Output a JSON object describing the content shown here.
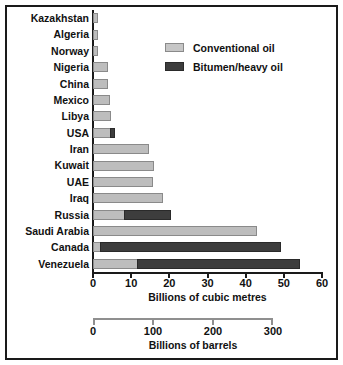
{
  "chart_data": {
    "type": "bar",
    "orientation": "horizontal",
    "stacked": true,
    "title": "",
    "xlabel": "Billions of cubic metres",
    "ylabel": "",
    "xlim": [
      0,
      60
    ],
    "xticks": [
      0,
      10,
      20,
      30,
      40,
      50,
      60
    ],
    "grid": false,
    "legend_position": "upper-right-inside",
    "categories": [
      "Kazakhstan",
      "Algeria",
      "Norway",
      "Nigeria",
      "China",
      "Mexico",
      "Libya",
      "USA",
      "Iran",
      "Kuwait",
      "UAE",
      "Iraq",
      "Russia",
      "Saudi Arabia",
      "Canada",
      "Venezuela"
    ],
    "series": [
      {
        "name": "Conventional oil",
        "color": "#bdbdbd",
        "values": [
          1.2,
          1.2,
          1.2,
          4.0,
          3.8,
          4.4,
          4.8,
          4.6,
          14.6,
          16.0,
          15.6,
          18.4,
          8.4,
          43.0,
          2.2,
          11.8
        ]
      },
      {
        "name": "Bitumen/heavy oil",
        "color": "#3d3d3d",
        "values": [
          0,
          0,
          0,
          0,
          0,
          0,
          0,
          1.4,
          0,
          0,
          0,
          0,
          12.4,
          0,
          47.2,
          42.8
        ]
      }
    ],
    "secondary_axis": {
      "xlabel": "Billions of barrels",
      "xticks": [
        0,
        100,
        200,
        300
      ],
      "xlim": [
        0,
        300
      ],
      "unit_ratio_barrels_per_cubic_metre": 6.29
    }
  },
  "legend": {
    "items": [
      {
        "label": "Conventional oil",
        "swatch": "light-gray-swatch"
      },
      {
        "label": "Bitumen/heavy oil",
        "swatch": "dark-gray-swatch"
      }
    ]
  },
  "axes": {
    "primary_label": "Billions of cubic metres",
    "secondary_label": "Billions of barrels",
    "primary_ticks": [
      "0",
      "10",
      "20",
      "30",
      "40",
      "50",
      "60"
    ],
    "secondary_ticks": [
      "0",
      "100",
      "200",
      "300"
    ]
  }
}
